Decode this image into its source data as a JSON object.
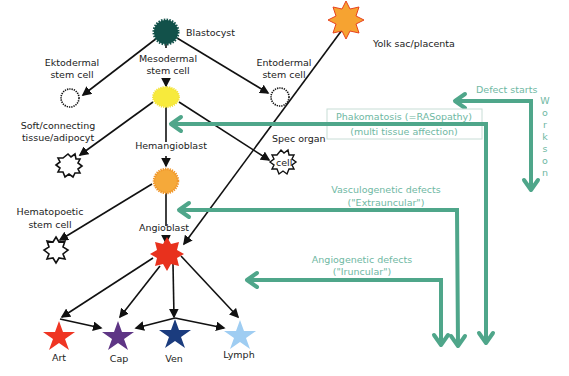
{
  "diagram": {
    "nodes": {
      "blastocyst": "Blastocyst",
      "yolk_sac": "Yolk sac/placenta",
      "ektodermal_1": "Ektodermal",
      "ektodermal_2": "stem cell",
      "mesodermal_1": "Mesodermal",
      "mesodermal_2": "stem cell",
      "entodermal_1": "Entodermal",
      "entodermal_2": "stem cell",
      "soft_1": "Soft/connecting",
      "soft_2": "tissue/adipocyt",
      "hemangioblast": "Hemangioblast",
      "spec_organ_1": "Spec organ",
      "spec_organ_2": "cell",
      "hematopoetic_1": "Hematopoetic",
      "hematopoetic_2": "stem cell",
      "angioblast": "Angioblast",
      "art": "Art",
      "cap": "Cap",
      "ven": "Ven",
      "lymph": "Lymph"
    },
    "defects": {
      "defect_starts": "Defect starts",
      "works_on": [
        "W",
        "o",
        "r",
        "k",
        "s",
        "o",
        "n"
      ],
      "phakomatosis": "Phakomatosis (=RASopathy)",
      "multi_tissue": "(multi tissue affection)",
      "vasculogenetic_1": "Vasculogenetic defects",
      "vasculogenetic_2": "(\"Extrauncular\")",
      "angiogenetic_1": "Angiogenetic defects",
      "angiogenetic_2": "(\"Iruncular\")"
    },
    "colors": {
      "blastocyst": "#12514a",
      "mesodermal": "#f7ea3c",
      "hemangioblast": "#f5a93a",
      "angioblast": "#e8311d",
      "yolk_sac": "#f6a331",
      "art": "#ef3523",
      "cap": "#5e3585",
      "ven": "#1b3c7e",
      "lymph": "#9fcdf2",
      "defect_arrow": "#4fa68a",
      "defect_text": "#6fb8a3"
    }
  }
}
